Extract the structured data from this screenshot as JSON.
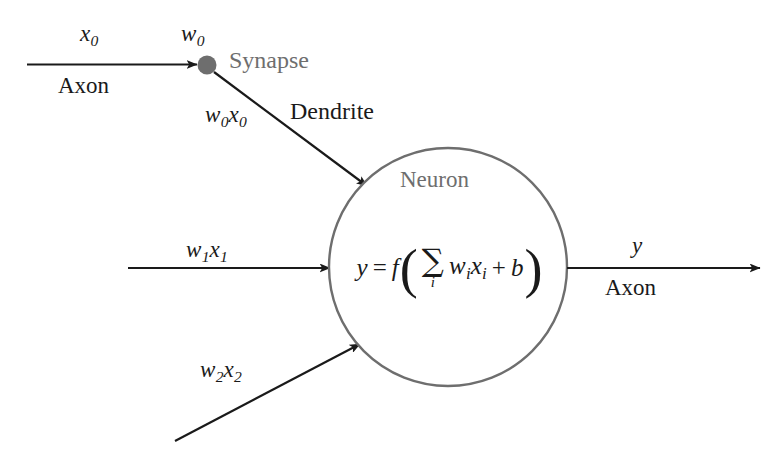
{
  "diagram": {
    "background_color": "#ffffff",
    "stroke_color": "#1a1a1a",
    "neuron_outline_color": "#6e6e6e",
    "gray_label_color": "#6e6e6e",
    "synapse_fill_color": "#6e6e6e"
  },
  "labels": {
    "input_value_0": "x",
    "input_value_0_sub": "0",
    "axon_in": "Axon",
    "weight_0": "w",
    "weight_0_sub": "0",
    "synapse": "Synapse",
    "weighted_input_0": "w",
    "weighted_input_0_sub_a": "0",
    "weighted_input_0_b": "x",
    "weighted_input_0_sub_b": "0",
    "dendrite": "Dendrite",
    "neuron": "Neuron",
    "weighted_input_1": "w",
    "weighted_input_1_sub_a": "1",
    "weighted_input_1_b": "x",
    "weighted_input_1_sub_b": "1",
    "weighted_input_2": "w",
    "weighted_input_2_sub_a": "2",
    "weighted_input_2_b": "x",
    "weighted_input_2_sub_b": "2",
    "output_value": "y",
    "axon_out": "Axon"
  },
  "formula": {
    "lhs": "y",
    "equals": "=",
    "activation_fn": "f",
    "open_paren": "(",
    "sigma": "∑",
    "sigma_index": "i",
    "weight_symbol": "w",
    "weight_sub": "i",
    "input_symbol": "x",
    "input_sub": "i",
    "plus": "+",
    "bias": "b",
    "close_paren": ")",
    "plain_text": "y = f( ∑i wi xi + b )"
  },
  "geometry": {
    "neuron_center_x": 448,
    "neuron_center_y": 267,
    "neuron_radius": 119,
    "synapse_x": 207,
    "synapse_y": 65,
    "synapse_radius": 9
  }
}
